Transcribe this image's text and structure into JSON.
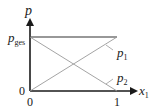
{
  "diagram": {
    "y_axis_label": "p",
    "x_axis_label": "x",
    "x_axis_subscript": "1",
    "y_level_label": "p",
    "y_level_subscript": "ges",
    "origin_y_label": "0",
    "origin_x_label": "0",
    "x_end_label": "1",
    "curves": [
      {
        "name": "p1",
        "label": "p",
        "subscript": "1",
        "from": [
          0,
          0
        ],
        "to": [
          1,
          1
        ]
      },
      {
        "name": "p2",
        "label": "p",
        "subscript": "2",
        "from": [
          0,
          1
        ],
        "to": [
          1,
          0
        ]
      },
      {
        "name": "pges",
        "label": "p_ges",
        "from": [
          0,
          1
        ],
        "to": [
          1,
          1
        ]
      }
    ],
    "colors": {
      "axis": "#1a1a1a",
      "total_line": "#333333",
      "partial_lines": "#9a9a9a"
    }
  }
}
